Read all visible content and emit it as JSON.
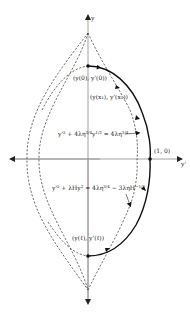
{
  "figure": {
    "axes": {
      "vertical_label": "y",
      "horizontal_label": "y'"
    },
    "points": {
      "start": "(y(0), y'(0))",
      "intermediate": "(y(x₁), y'(x₁))",
      "right_intercept": "(1, 0)",
      "end": "(y(ℓ), y'(ℓ))"
    },
    "curves": {
      "upper_bound": {
        "base": "y'² + 4λη",
        "exp1": "3/4",
        "mid": "y",
        "exp2": "1/2",
        "tail": " = 4λη",
        "exp3": "3/4"
      },
      "lower_bound": {
        "base": "y'² + λHy",
        "exp1": "2",
        "mid": " = 4λη",
        "exp2": "3/4",
        "tail": " − 3ληH",
        "exp3": "−1/3"
      }
    },
    "colors": {
      "ink": "#111111",
      "axis": "#8a8a8a",
      "background": "#ffffff"
    }
  }
}
